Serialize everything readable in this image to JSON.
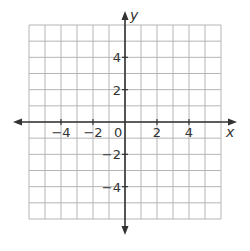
{
  "chart_data": {
    "type": "coordinate-grid",
    "title": "",
    "xlabel": "x",
    "ylabel": "y",
    "xlim": [
      -6,
      6
    ],
    "ylim": [
      -6,
      6
    ],
    "grid": true,
    "grid_step": 1,
    "x_ticks": [
      -4,
      -2,
      2,
      4
    ],
    "x_tick_labels": [
      "−4",
      "−2",
      "2",
      "4"
    ],
    "y_ticks": [
      4,
      2,
      -2,
      -4
    ],
    "y_tick_labels": [
      "4",
      "2",
      "−2",
      "−4"
    ],
    "origin_label": "0",
    "series": []
  },
  "colors": {
    "grid": "#b5b5b5",
    "axis": "#333333",
    "text": "#333333"
  }
}
